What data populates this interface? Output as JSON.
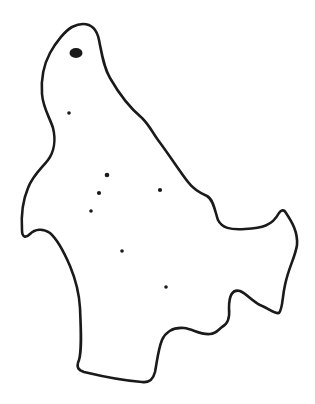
{
  "map": {
    "type": "outline-map",
    "background": "#ffffff",
    "stroke_color": "#1a1a1a",
    "outline_path": "M83,24 C92,24 97,30 99,40 C102,55 104,68 110,78 C118,92 130,108 142,118 C150,126 152,132 158,140 C170,156 180,172 188,182 C194,190 200,193 207,196 C214,200 215,212 218,220 C222,228 230,230 245,229 C262,228 272,226 279,213 C281,210 284,209 286,213 C292,222 298,232 297,245 C295,258 289,266 285,285 C282,298 283,308 279,313 C274,314 270,309 260,305 C252,301 247,294 240,291 C232,289 229,296 229,308 C230,318 228,324 222,327 C218,330 216,334 210,334 C200,335 193,329 184,328 C172,327 165,333 162,340 C158,350 157,362 155,372 C153,380 149,383 142,382 C128,381 105,377 84,372 C78,370 76,367 79,360 C82,350 81,330 80,308 C79,290 75,278 70,266 C64,252 58,240 50,233 C43,228 35,229 30,234 C26,238 22,238 22,230 C21,215 23,200 28,188 C33,175 42,168 48,160 C54,152 56,140 53,128 C50,118 43,108 42,94 C41,80 43,66 50,53 C56,42 65,31 72,27 C76,25 79,24 83,24 Z",
    "stroke_width": 2.6,
    "markers": [
      {
        "name": "capital",
        "cx": 76,
        "cy": 53,
        "rx": 6.5,
        "ry": 5
      },
      {
        "name": "city-1",
        "cx": 69,
        "cy": 113,
        "r": 1.8
      },
      {
        "name": "city-2",
        "cx": 107,
        "cy": 175,
        "r": 2.3
      },
      {
        "name": "city-3",
        "cx": 99,
        "cy": 193,
        "r": 2.1
      },
      {
        "name": "city-4",
        "cx": 91,
        "cy": 211,
        "r": 1.8
      },
      {
        "name": "city-5",
        "cx": 160,
        "cy": 190,
        "r": 2.1
      },
      {
        "name": "city-6",
        "cx": 122,
        "cy": 251,
        "r": 1.8
      },
      {
        "name": "city-7",
        "cx": 166,
        "cy": 287,
        "r": 1.8
      }
    ]
  }
}
